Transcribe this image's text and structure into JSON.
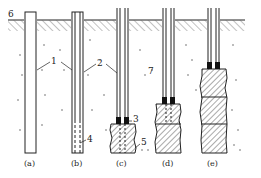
{
  "figure": {
    "ground_label": "6",
    "stages": [
      {
        "id": "a",
        "caption": "(a)"
      },
      {
        "id": "b",
        "caption": "(b)"
      },
      {
        "id": "c",
        "caption": "(c)"
      },
      {
        "id": "d",
        "caption": "(d)"
      },
      {
        "id": "e",
        "caption": "(e)"
      }
    ],
    "callouts": {
      "casing": "1",
      "grout_pipe": "2",
      "packer": "3",
      "perforated_section": "4",
      "grouted_zone": "5",
      "ground_surface": "6",
      "soil": "7"
    },
    "colors": {
      "line": "#222222",
      "hatch": "#555555",
      "packer": "#111111",
      "soil_dots": "#666666"
    }
  }
}
